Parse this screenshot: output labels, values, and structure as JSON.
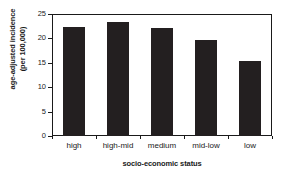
{
  "chart_data": {
    "type": "bar",
    "title": "",
    "subtitle": "",
    "xlabel": "socio-economic status",
    "ylabel": "age-adjusted incidence (per 100,000)",
    "ylabel_lines": [
      "age-adjusted incidence",
      "(per 100,000)"
    ],
    "categories": [
      "high",
      "high-mid",
      "medium",
      "mid-low",
      "low"
    ],
    "values": [
      22.4,
      23.3,
      22.2,
      19.6,
      15.4
    ],
    "ylim": [
      0,
      25
    ],
    "yticks": [
      0,
      5,
      10,
      15,
      20,
      25
    ],
    "ytick_labels": [
      "0",
      "5",
      "10",
      "15",
      "20",
      "25"
    ],
    "grid": false,
    "legend": false,
    "bar_color": "#231f20",
    "axis_color": "#1a1a1a",
    "background": "#ffffff"
  }
}
